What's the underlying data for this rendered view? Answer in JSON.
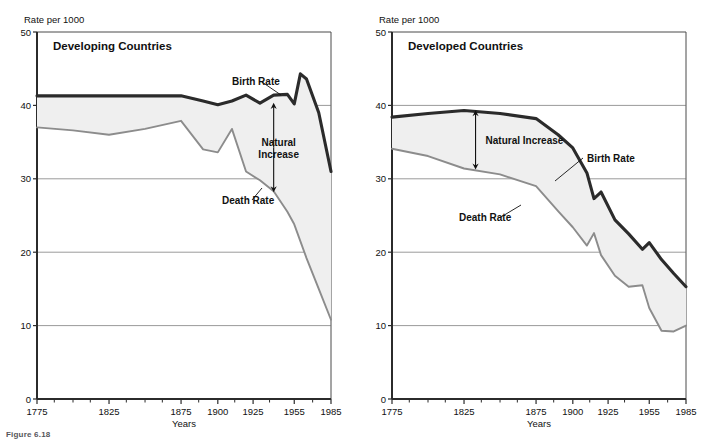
{
  "figure": {
    "caption": "Figure 6.18",
    "panel_count": 2
  },
  "chart_data": [
    {
      "type": "line",
      "title": "Developing Countries",
      "xlabel": "Years",
      "ylabel": "Rate per 1000",
      "ylim": [
        0,
        50
      ],
      "yticks": [
        0,
        10,
        20,
        30,
        40,
        50
      ],
      "ytick_labels": [
        "0",
        "10",
        "20",
        "30",
        "40",
        "50"
      ],
      "grid": "horizontal",
      "xticks": [
        1775,
        1825,
        1875,
        1900,
        1925,
        1955,
        1985
      ],
      "xtick_labels": [
        "1775",
        "1825",
        "1875",
        "1900",
        "1925",
        "1955",
        "1985"
      ],
      "legend": "inline-labels",
      "annotations": [
        {
          "text": "Natural Increase",
          "kind": "double-arrow",
          "at_year": 1940,
          "from": 28.3,
          "to": 40.2
        },
        {
          "text": "Birth Rate",
          "kind": "leader-line",
          "at_year": 1925
        },
        {
          "text": "Death Rate",
          "kind": "leader-line",
          "at_year": 1930
        }
      ],
      "series": [
        {
          "name": "Birth Rate",
          "style": "thick-dark",
          "color": "#2b2b2b",
          "x": [
            1775,
            1800,
            1825,
            1850,
            1875,
            1890,
            1900,
            1910,
            1920,
            1930,
            1940,
            1950,
            1955,
            1960,
            1965,
            1975,
            1985
          ],
          "values": [
            41.3,
            41.3,
            41.3,
            41.3,
            41.3,
            40.6,
            40.1,
            40.6,
            41.4,
            40.3,
            41.4,
            41.5,
            40.2,
            44.3,
            43.6,
            39.0,
            31.0
          ]
        },
        {
          "name": "Death Rate",
          "style": "thin-gray",
          "color": "#8c8c8c",
          "x": [
            1775,
            1800,
            1825,
            1850,
            1875,
            1890,
            1900,
            1910,
            1920,
            1930,
            1940,
            1950,
            1955,
            1965,
            1975,
            1985
          ],
          "values": [
            37.0,
            36.6,
            36.0,
            36.8,
            37.9,
            34.0,
            33.6,
            36.8,
            31.0,
            29.8,
            28.3,
            25.5,
            23.8,
            19.2,
            15.0,
            10.8
          ]
        }
      ],
      "fill_between": {
        "label": "Natural Increase",
        "color": "#efefef"
      }
    },
    {
      "type": "line",
      "title": "Developed Countries",
      "xlabel": "Years",
      "ylabel": "Rate per 1000",
      "ylim": [
        0,
        50
      ],
      "yticks": [
        0,
        10,
        20,
        30,
        40,
        50
      ],
      "ytick_labels": [
        "0",
        "10",
        "20",
        "30",
        "40",
        "50"
      ],
      "grid": "horizontal",
      "xticks": [
        1775,
        1825,
        1875,
        1900,
        1925,
        1955,
        1985
      ],
      "xtick_labels": [
        "1775",
        "1825",
        "1875",
        "1900",
        "1925",
        "1955",
        "1985"
      ],
      "legend": "inline-labels",
      "annotations": [
        {
          "text": "Natural Increase",
          "kind": "double-arrow",
          "at_year": 1833,
          "from": 31.4,
          "to": 39.2
        },
        {
          "text": "Birth Rate",
          "kind": "leader-line",
          "at_year": 1915
        },
        {
          "text": "Death Rate",
          "kind": "leader-line",
          "at_year": 1880
        }
      ],
      "series": [
        {
          "name": "Birth Rate",
          "style": "thick-dark",
          "color": "#2b2b2b",
          "x": [
            1775,
            1800,
            1825,
            1850,
            1875,
            1890,
            1900,
            1910,
            1915,
            1920,
            1930,
            1940,
            1950,
            1955,
            1965,
            1975,
            1985
          ],
          "values": [
            38.4,
            38.9,
            39.3,
            38.9,
            38.2,
            36.0,
            34.2,
            30.8,
            27.3,
            28.2,
            24.4,
            22.5,
            20.4,
            21.3,
            19.0,
            17.1,
            15.3
          ]
        },
        {
          "name": "Death Rate",
          "style": "thin-gray",
          "color": "#8c8c8c",
          "x": [
            1775,
            1800,
            1825,
            1850,
            1875,
            1890,
            1900,
            1910,
            1915,
            1920,
            1930,
            1940,
            1950,
            1955,
            1965,
            1975,
            1985
          ],
          "values": [
            34.1,
            33.1,
            31.4,
            30.6,
            29.0,
            25.6,
            23.4,
            20.9,
            22.6,
            19.6,
            16.8,
            15.3,
            15.5,
            12.4,
            9.3,
            9.2,
            10.0
          ]
        }
      ],
      "fill_between": {
        "label": "Natural Increase",
        "color": "#efefef"
      }
    }
  ]
}
